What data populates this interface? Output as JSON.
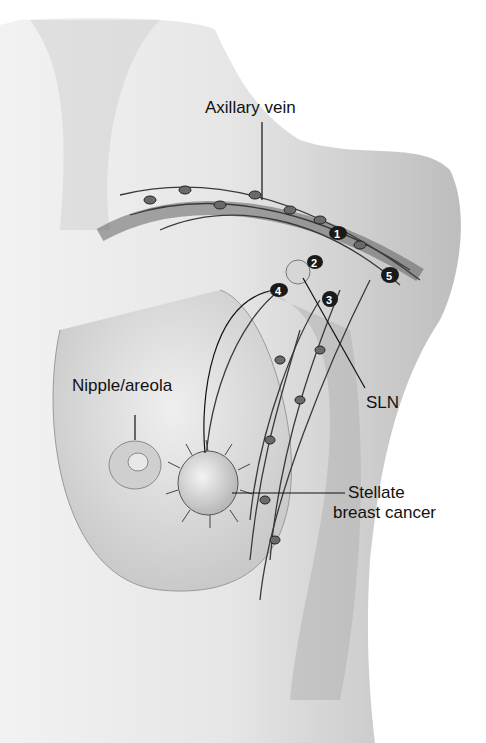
{
  "figure": {
    "labels": {
      "axillary_vein": "Axillary vein",
      "nipple_areola": "Nipple/areola",
      "sln": "SLN",
      "stellate_line1": "Stellate",
      "stellate_line2": "breast cancer"
    },
    "node_numbers": [
      "1",
      "2",
      "3",
      "4",
      "5"
    ],
    "colors": {
      "skin_light": "#e8e8e8",
      "skin_shade": "#a8a8a8",
      "vessel": "#3a3a3a",
      "node_dark": "#1a1a1a"
    }
  }
}
